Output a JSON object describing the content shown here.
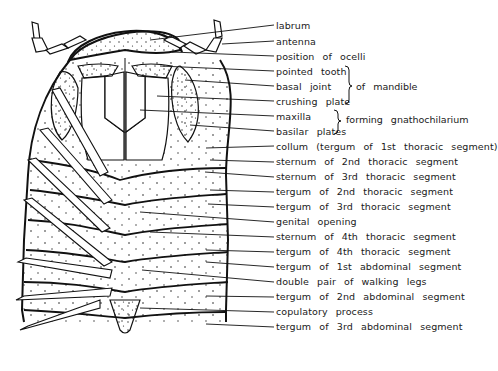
{
  "figure": {
    "labels": [
      {
        "id": "labrum",
        "text": "labrum",
        "y": 20
      },
      {
        "id": "antenna",
        "text": "antenna",
        "y": 36
      },
      {
        "id": "ocelli",
        "text": "position of ocelli",
        "y": 51
      },
      {
        "id": "pointed-tooth",
        "text": "pointed tooth",
        "y": 66
      },
      {
        "id": "basal-joint",
        "text": "basal joint",
        "y": 81
      },
      {
        "id": "crushing-plate",
        "text": "crushing plate",
        "y": 96
      },
      {
        "id": "maxilla",
        "text": "maxilla",
        "y": 111
      },
      {
        "id": "basilar-plates",
        "text": "basilar plates",
        "y": 126
      },
      {
        "id": "collum",
        "text": "collum (tergum of 1st thoracic segment)",
        "y": 141
      },
      {
        "id": "sternum-2",
        "text": "sternum of 2nd thoracic segment",
        "y": 156
      },
      {
        "id": "sternum-3",
        "text": "sternum of 3rd thoracic segment",
        "y": 171
      },
      {
        "id": "tergum-2",
        "text": "tergum of 2nd thoracic segment",
        "y": 186
      },
      {
        "id": "tergum-3",
        "text": "tergum of 3rd thoracic segment",
        "y": 201
      },
      {
        "id": "genital-opening",
        "text": "genital opening",
        "y": 216
      },
      {
        "id": "sternum-4",
        "text": "sternum of 4th thoracic segment",
        "y": 231
      },
      {
        "id": "tergum-4",
        "text": "tergum of 4th thoracic segment",
        "y": 246
      },
      {
        "id": "tergum-abd-1",
        "text": "tergum of 1st abdominal segment",
        "y": 261
      },
      {
        "id": "double-legs",
        "text": "double pair of walking legs",
        "y": 276
      },
      {
        "id": "tergum-abd-2",
        "text": "tergum of 2nd abdominal segment",
        "y": 291
      },
      {
        "id": "copulatory",
        "text": "copulatory process",
        "y": 306
      },
      {
        "id": "tergum-abd-3",
        "text": "tergum of 3rd abdominal segment",
        "y": 321
      }
    ],
    "groups": [
      {
        "id": "mandible-group",
        "text": "of mandible",
        "y": 81
      },
      {
        "id": "gnathochilarium-group",
        "text": "forming gnathochilarium",
        "y": 116
      }
    ]
  }
}
